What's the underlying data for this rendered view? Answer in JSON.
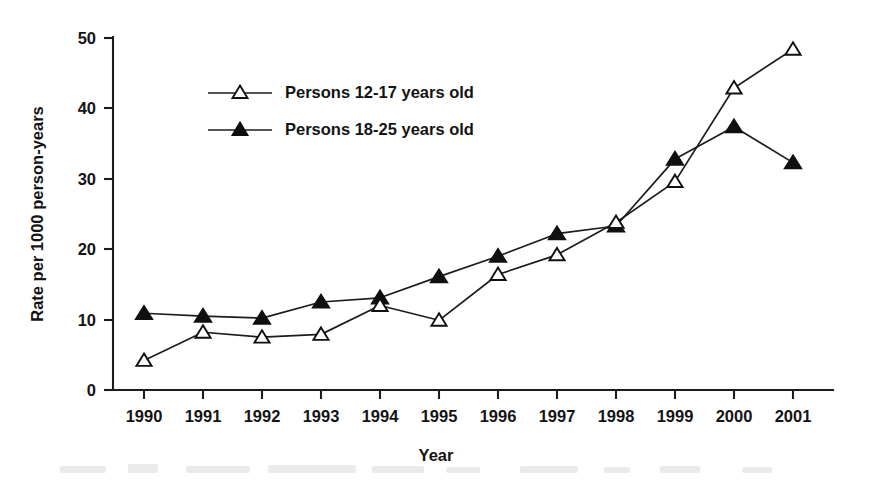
{
  "chart_data": {
    "type": "line",
    "title": "",
    "xlabel": "Year",
    "ylabel": "Rate per 1000 person-years",
    "categories": [
      "1990",
      "1991",
      "1992",
      "1993",
      "1994",
      "1995",
      "1996",
      "1997",
      "1998",
      "1999",
      "2000",
      "2001"
    ],
    "x": [
      1990,
      1991,
      1992,
      1993,
      1994,
      1995,
      1996,
      1997,
      1998,
      1999,
      2000,
      2001
    ],
    "xlim": [
      1990,
      2001
    ],
    "ylim": [
      0,
      50
    ],
    "yticks": [
      0,
      10,
      20,
      30,
      40,
      50
    ],
    "ytick_labels": [
      "0",
      "10",
      "20",
      "30",
      "40",
      "50"
    ],
    "xticks": [
      1990,
      1991,
      1992,
      1993,
      1994,
      1995,
      1996,
      1997,
      1998,
      1999,
      2000,
      2001
    ],
    "xtick_labels": [
      "1990",
      "1991",
      "1992",
      "1993",
      "1994",
      "1995",
      "1996",
      "1997",
      "1998",
      "1999",
      "2000",
      "2001"
    ],
    "grid": false,
    "legend_position": "upper-left-inside",
    "series": [
      {
        "name": "Persons 12-17 years old",
        "marker": "open-triangle",
        "color": "#101010",
        "values": [
          4.2,
          8.2,
          7.5,
          7.9,
          12.0,
          9.9,
          16.4,
          19.2,
          23.8,
          29.6,
          42.9,
          48.4
        ]
      },
      {
        "name": "Persons 18-25 years old",
        "marker": "filled-triangle",
        "color": "#101010",
        "values": [
          10.9,
          10.5,
          10.2,
          12.5,
          13.1,
          16.1,
          19.0,
          22.2,
          23.3,
          32.8,
          37.4,
          32.3
        ]
      }
    ]
  },
  "legend": {
    "entries": [
      {
        "label": "Persons 12-17 years old",
        "marker": "open-triangle"
      },
      {
        "label": "Persons 18-25 years old",
        "marker": "filled-triangle"
      }
    ]
  },
  "axes": {
    "y_title": "Rate per 1000 person-years",
    "x_title": "Year"
  }
}
